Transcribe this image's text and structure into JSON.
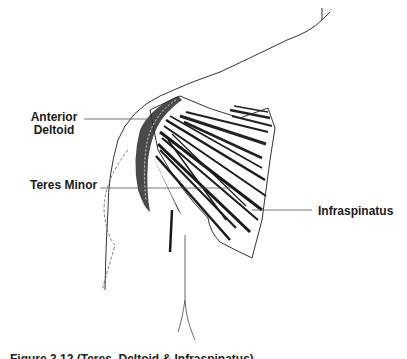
{
  "figure": {
    "type": "anatomical line illustration",
    "labels": {
      "anterior_deltoid_line1": "Anterior",
      "anterior_deltoid_line2": "Deltoid",
      "teres_minor": "Teres Minor",
      "infraspinatus": "Infraspinatus"
    },
    "caption_partial": "Figure 3.12 (Teres, Deltoid & Infraspinatus)"
  },
  "colors": {
    "ink": "#1a1a1a",
    "background": "#ffffff",
    "leader_line": "#555555"
  }
}
